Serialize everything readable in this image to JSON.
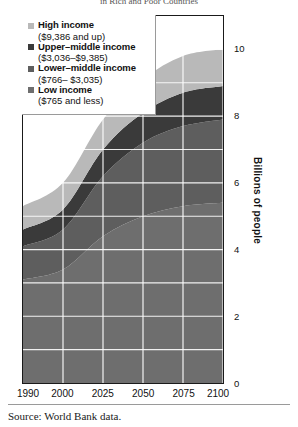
{
  "title": "in Rich and Poor Countries",
  "legend": {
    "items": [
      {
        "label": "High income",
        "range": "($9,386 and up)",
        "color": "#b9b9b9"
      },
      {
        "label": "Upper–middle income",
        "range": "($3,036–$9,385)",
        "color": "#3a3a3a"
      },
      {
        "label": "Lower–middle income",
        "range": "($766– $3,035)",
        "color": "#5e5e5e"
      },
      {
        "label": "Low income",
        "range": "($765 and less)",
        "color": "#6e6e6e"
      }
    ]
  },
  "footer": {
    "source": "Source: World Bank data."
  },
  "chart_data": {
    "type": "area",
    "title": "in Rich and Poor Countries",
    "xlabel": "",
    "ylabel": "Billions of people",
    "xlim": [
      1990,
      2100
    ],
    "ylim": [
      0,
      11
    ],
    "grid": true,
    "stacked": true,
    "legend_position": "top-left",
    "x": [
      1990,
      2000,
      2025,
      2050,
      2075,
      2100
    ],
    "xticks": [
      "1990",
      "2000",
      "2025",
      "2050",
      "2075",
      "2100"
    ],
    "yticks": [
      "0",
      "2",
      "4",
      "6",
      "8",
      "10"
    ],
    "ytick_values": [
      0,
      2,
      4,
      6,
      8,
      10
    ],
    "series": [
      {
        "name": "Low income",
        "color": "#6e6e6e",
        "values": [
          3.1,
          3.4,
          4.4,
          5.0,
          5.3,
          5.4
        ]
      },
      {
        "name": "Lower–middle income",
        "color": "#5e5e5e",
        "values": [
          1.0,
          1.2,
          1.8,
          2.2,
          2.4,
          2.5
        ]
      },
      {
        "name": "Upper–middle income",
        "color": "#3a3a3a",
        "values": [
          0.5,
          0.6,
          0.8,
          0.9,
          1.0,
          1.0
        ]
      },
      {
        "name": "High income",
        "color": "#b9b9b9",
        "values": [
          0.7,
          0.8,
          0.9,
          1.0,
          1.1,
          1.1
        ]
      }
    ],
    "totals": [
      5.3,
      6.0,
      7.9,
      9.1,
      9.8,
      10.0
    ]
  },
  "yticklabels": [
    "10",
    "8",
    "6",
    "4",
    "2",
    "0"
  ],
  "xticklabels": [
    "1990",
    "2000",
    "2025",
    "2050",
    "2075",
    "2100"
  ]
}
